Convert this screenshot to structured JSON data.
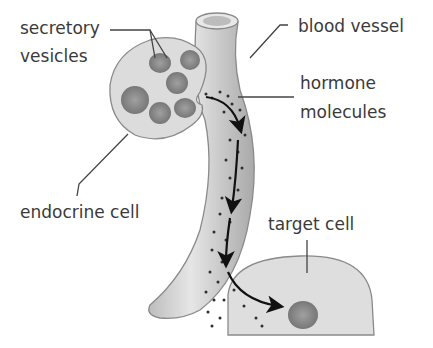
{
  "diagram": {
    "labels": {
      "secretory_vesicles_line1": "secretory",
      "secretory_vesicles_line2": "vesicles",
      "blood_vessel": "blood vessel",
      "hormone_line1": "hormone",
      "hormone_line2": "molecules",
      "endocrine_cell": "endocrine cell",
      "target_cell": "target cell"
    },
    "colors": {
      "cell_fill": "#dcdcdc",
      "cell_stroke": "#8a8a8a",
      "vesicle_fill": "#8c8c8c",
      "vessel_fill": "#cfcfcf",
      "vessel_stroke": "#8a8a8a",
      "dot": "#2e2e2e",
      "text": "#3a3a3a"
    }
  }
}
